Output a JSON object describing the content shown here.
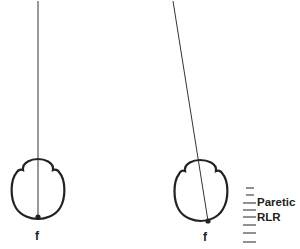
{
  "diagram": {
    "panels": [
      {
        "id": "left",
        "description": "Head viewed from above with vertical line of sight through fovea",
        "fixation_label": "f",
        "line": {
          "x1": 38,
          "y1": 0,
          "x2": 38,
          "y2": 217
        },
        "dot": {
          "x": 38,
          "y": 217
        }
      },
      {
        "id": "right",
        "description": "Head viewed from above with tilted line of sight",
        "fixation_label": "f",
        "line": {
          "x1": 173,
          "y1": 0,
          "x2": 208,
          "y2": 221
        },
        "dot": {
          "x": 208,
          "y": 221
        }
      }
    ],
    "scale": {
      "tick_count": 8,
      "label_line1": "Paretic",
      "label_line2": "RLR"
    },
    "colors": {
      "stroke": "#222222",
      "text": "#222222",
      "ticks": "#555555",
      "background": "#ffffff"
    }
  }
}
